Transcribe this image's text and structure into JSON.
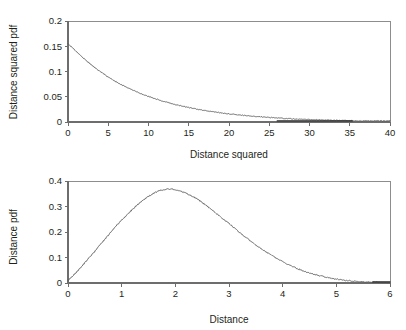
{
  "figure": {
    "background": "#ffffff",
    "curve_color": "#5b5b5b",
    "axis_color": "#6d6d6d",
    "text_color": "#231f20"
  },
  "chart_data": [
    {
      "type": "line",
      "id": "distance-squared-pdf",
      "title": "",
      "xlabel": "Distance squared",
      "ylabel": "Distance squared pdf",
      "xlim": [
        0,
        40
      ],
      "ylim": [
        0,
        0.2
      ],
      "xticks": [
        0,
        5,
        10,
        15,
        20,
        25,
        30,
        35,
        40
      ],
      "xtick_labels": [
        "0",
        "5",
        "10",
        "15",
        "20",
        "25",
        "30",
        "35",
        "40"
      ],
      "yticks": [
        0,
        0.05,
        0.1,
        0.15,
        0.2
      ],
      "ytick_labels": [
        "0",
        "0.05",
        "0.1",
        "0.15",
        "0.2"
      ],
      "grid": false,
      "legend": null,
      "description": "Monotonically decreasing exponential-like density starting near 0.155 at x=0 and decaying toward 0 beyond x=25; a darker flat segment hugs zero from about x=26 to x=35.",
      "x": [
        0,
        0.5,
        1,
        1.5,
        2,
        2.5,
        3,
        3.5,
        4,
        4.5,
        5,
        5.5,
        6,
        6.5,
        7,
        7.5,
        8,
        8.5,
        9,
        9.5,
        10,
        11,
        12,
        13,
        14,
        15,
        16,
        17,
        18,
        19,
        20,
        21,
        22,
        23,
        24,
        25,
        26,
        27,
        28,
        30,
        32,
        34,
        35,
        36
      ],
      "values": [
        0.155,
        0.148,
        0.14,
        0.1325,
        0.1255,
        0.1185,
        0.112,
        0.1055,
        0.1,
        0.0945,
        0.089,
        0.084,
        0.0795,
        0.075,
        0.071,
        0.0672,
        0.0635,
        0.06,
        0.0567,
        0.0536,
        0.0506,
        0.0452,
        0.0404,
        0.036,
        0.0322,
        0.0287,
        0.0256,
        0.0228,
        0.0203,
        0.0181,
        0.0161,
        0.0143,
        0.0127,
        0.0113,
        0.01,
        0.0089,
        0.0079,
        0.007,
        0.0062,
        0.0048,
        0.0038,
        0.0029,
        0.0025,
        0.0022
      ],
      "dark_tail_range": [
        26,
        35.3
      ]
    },
    {
      "type": "line",
      "id": "distance-pdf",
      "title": "",
      "xlabel": "Distance",
      "ylabel": "Distance pdf",
      "xlim": [
        0,
        6
      ],
      "ylim": [
        0,
        0.4
      ],
      "xticks": [
        0,
        1,
        2,
        3,
        4,
        5,
        6
      ],
      "xtick_labels": [
        "0",
        "1",
        "2",
        "3",
        "4",
        "5",
        "6"
      ],
      "yticks": [
        0,
        0.1,
        0.2,
        0.3,
        0.4
      ],
      "ytick_labels": [
        "0",
        "0.1",
        "0.2",
        "0.3",
        "0.4"
      ],
      "grid": false,
      "legend": null,
      "description": "Unimodal Rayleigh-like density rising from about 0.01 at x=0 to a noisy peak near 0.37 at x=1.9, then decaying to near 0 by x=5.7; a darker flat segment hugs zero from about x=5.7 to x=6.",
      "x": [
        0,
        0.1,
        0.2,
        0.3,
        0.4,
        0.5,
        0.6,
        0.7,
        0.8,
        0.9,
        1.0,
        1.1,
        1.2,
        1.3,
        1.4,
        1.5,
        1.6,
        1.7,
        1.8,
        1.9,
        2.0,
        2.1,
        2.2,
        2.3,
        2.4,
        2.5,
        2.6,
        2.7,
        2.8,
        2.9,
        3.0,
        3.2,
        3.4,
        3.6,
        3.8,
        4.0,
        4.2,
        4.4,
        4.6,
        4.8,
        5.0,
        5.2,
        5.4,
        5.6,
        5.8,
        6.0
      ],
      "values": [
        0.01,
        0.03,
        0.052,
        0.076,
        0.1,
        0.124,
        0.15,
        0.175,
        0.2,
        0.224,
        0.247,
        0.268,
        0.288,
        0.308,
        0.325,
        0.34,
        0.352,
        0.362,
        0.367,
        0.369,
        0.366,
        0.36,
        0.352,
        0.342,
        0.33,
        0.316,
        0.3,
        0.284,
        0.267,
        0.25,
        0.233,
        0.198,
        0.165,
        0.134,
        0.107,
        0.083,
        0.063,
        0.046,
        0.033,
        0.023,
        0.015,
        0.01,
        0.006,
        0.004,
        0.002,
        0.001
      ],
      "dark_tail_range": [
        5.68,
        6.0
      ]
    }
  ]
}
